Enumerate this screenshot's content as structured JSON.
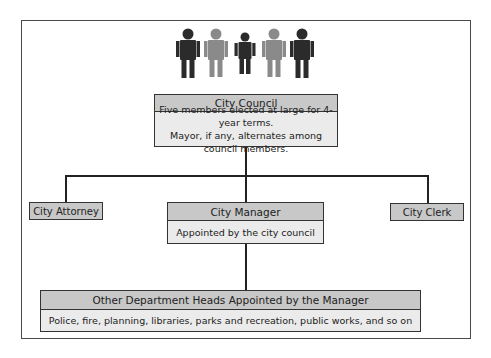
{
  "diagram": {
    "type": "council-manager government org chart",
    "icon": "people-group-icon",
    "colors": {
      "dark_figure": "#2b2b2b",
      "light_figure": "#8a8a8a",
      "header_fill": "#c8c8c8",
      "body_fill": "#ebebeb",
      "border": "#333333"
    },
    "council": {
      "title": "City Council",
      "lines": [
        "Five members elected at large for 4-year terms.",
        "Mayor, if any, alternates among council members."
      ]
    },
    "attorney": {
      "title": "City Attorney"
    },
    "clerk": {
      "title": "City Clerk"
    },
    "manager": {
      "title": "City Manager",
      "subtitle": "Appointed by the city council"
    },
    "departments": {
      "title": "Other Department Heads Appointed by the Manager",
      "subtitle": "Police, fire, planning, libraries, parks and recreation, public works, and so on"
    }
  }
}
